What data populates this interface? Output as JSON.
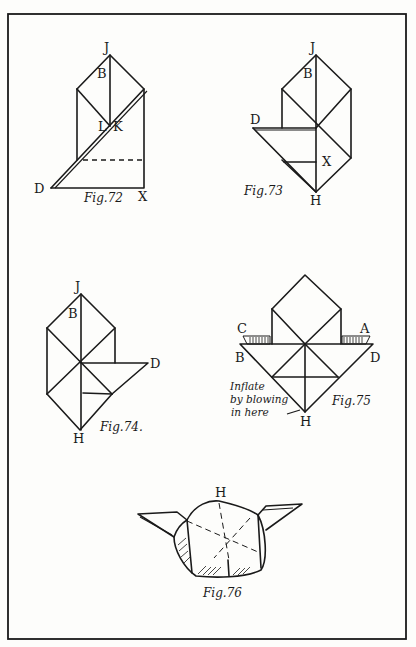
{
  "plate": {
    "border_color": "#1a1a1a",
    "background": "#fdfdfb"
  },
  "figures": [
    {
      "id": "fig72",
      "caption": "Fig.72",
      "labels": {
        "top": "J",
        "B": "B",
        "L": "L",
        "K": "K",
        "D": "D",
        "X": "X"
      }
    },
    {
      "id": "fig73",
      "caption": "Fig.73",
      "labels": {
        "top": "J",
        "B": "B",
        "D": "D",
        "X": "X",
        "bottom": "H"
      }
    },
    {
      "id": "fig74",
      "caption": "Fig.74.",
      "labels": {
        "top": "J",
        "B": "B",
        "D": "D",
        "bottom": "H"
      }
    },
    {
      "id": "fig75",
      "caption": "Fig.75",
      "labels": {
        "C": "C",
        "A": "A",
        "B": "B",
        "D": "D",
        "bottom": "H"
      },
      "annotation": [
        "Inflate",
        "by blowing",
        "in here"
      ]
    },
    {
      "id": "fig76",
      "caption": "Fig.76",
      "labels": {
        "top": "H"
      }
    }
  ]
}
